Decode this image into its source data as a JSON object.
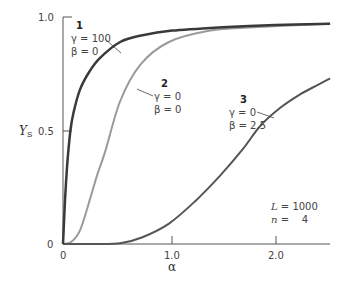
{
  "chart_data": {
    "type": "line",
    "title": "",
    "xlabel": "α",
    "ylabel": "Y_S",
    "xlim": [
      0,
      2.55
    ],
    "ylim": [
      0,
      1.0
    ],
    "grid": false,
    "xticks": [
      {
        "value": 0,
        "label": "0"
      },
      {
        "value": 1.0,
        "label": "1.0"
      },
      {
        "value": 2.0,
        "label": "2.0"
      }
    ],
    "yticks": [
      {
        "value": 0,
        "label": "0"
      },
      {
        "value": 0.5,
        "label": "0.5"
      },
      {
        "value": 1.0,
        "label": "1.0"
      }
    ],
    "series": [
      {
        "name": "1",
        "params": {
          "gamma": "γ = 100",
          "beta": "β = 0"
        },
        "color": "#3a3a3a",
        "x": [
          0,
          0.02,
          0.04,
          0.07,
          0.1,
          0.16,
          0.25,
          0.35,
          0.54,
          0.75,
          1.03,
          1.5,
          2.0,
          2.52
        ],
        "y": [
          0,
          0.2,
          0.35,
          0.5,
          0.58,
          0.68,
          0.76,
          0.82,
          0.89,
          0.92,
          0.94,
          0.955,
          0.965,
          0.97
        ]
      },
      {
        "name": "2",
        "params": {
          "gamma": "γ = 0",
          "beta": "β = 0"
        },
        "color": "#9a9a9a",
        "x": [
          0,
          0.08,
          0.16,
          0.25,
          0.32,
          0.4,
          0.54,
          0.73,
          1.0,
          1.39,
          1.8,
          2.52
        ],
        "y": [
          0,
          0.01,
          0.06,
          0.19,
          0.3,
          0.41,
          0.63,
          0.79,
          0.89,
          0.94,
          0.955,
          0.97
        ]
      },
      {
        "name": "3",
        "params": {
          "gamma": "γ = 0",
          "beta": "β = 2.5"
        },
        "color": "#555555",
        "x": [
          0,
          0.3,
          0.55,
          0.75,
          1.0,
          1.25,
          1.48,
          1.7,
          1.86,
          2.05,
          2.24,
          2.4,
          2.52
        ],
        "y": [
          0,
          0,
          0.005,
          0.03,
          0.09,
          0.19,
          0.3,
          0.42,
          0.52,
          0.6,
          0.66,
          0.7,
          0.73
        ]
      }
    ],
    "annotations": [
      {
        "text": "L = 1000",
        "position": "lower-right"
      },
      {
        "text": "n =   4",
        "position": "lower-right"
      }
    ]
  },
  "labels": {
    "y_axis": {
      "main": "Y",
      "sub": "S"
    },
    "x_axis": "α",
    "ytick_0": "0",
    "ytick_05": "0.5",
    "ytick_1": "1.0",
    "xtick_0": "0",
    "xtick_1": "1.0",
    "xtick_2": "2.0",
    "curve1_num": "1",
    "curve1_gamma": "γ = 100",
    "curve1_beta": "β = 0",
    "curve2_num": "2",
    "curve2_gamma": "γ = 0",
    "curve2_beta": "β = 0",
    "curve3_num": "3",
    "curve3_gamma": "γ = 0",
    "curve3_beta": "β = 2.5",
    "param_L_name": "L",
    "param_L_val": " = 1000",
    "param_n_name": "n",
    "param_n_val": " =    4"
  }
}
